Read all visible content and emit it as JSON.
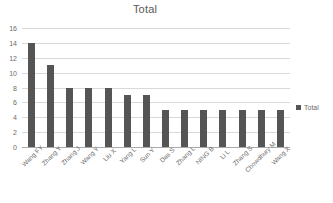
{
  "chart_data": {
    "type": "bar",
    "title": "Total",
    "xlabel": "",
    "ylabel": "",
    "ylim": [
      0,
      16
    ],
    "yticks": [
      0,
      2,
      4,
      6,
      8,
      10,
      12,
      14,
      16
    ],
    "grid": true,
    "legend": {
      "position": "right",
      "entries": [
        "Total"
      ]
    },
    "series_name": "Total",
    "series_color": "#555555",
    "categories": [
      "Wang FY",
      "Zhang Y",
      "Zhang J",
      "Wang Y",
      "Liu X",
      "Yang L",
      "Sun Y",
      "Das S",
      "Zhang L",
      "NING B",
      "Li L",
      "Zhang S",
      "Chowdhury M",
      "Wang X"
    ],
    "values": [
      14,
      11,
      8,
      8,
      8,
      7,
      7,
      5,
      5,
      5,
      5,
      5,
      5,
      5
    ]
  }
}
